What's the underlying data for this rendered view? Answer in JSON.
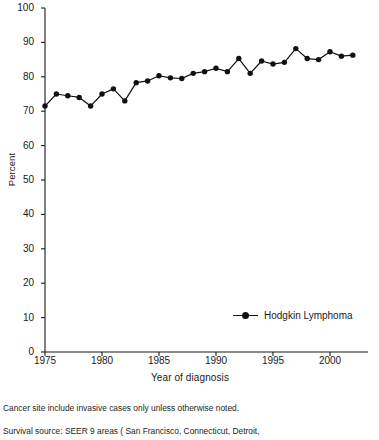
{
  "chart_data": {
    "type": "line",
    "title": "",
    "subtitle": "",
    "xlabel": "Year of diagnosis",
    "ylabel": "Percent",
    "xlim": [
      1975,
      2002
    ],
    "ylim": [
      0,
      100
    ],
    "ytick_values": [
      0,
      10,
      20,
      30,
      40,
      50,
      60,
      70,
      80,
      90,
      100
    ],
    "ytick_labels": [
      "0",
      "10",
      "20",
      "30",
      "40",
      "50",
      "60",
      "70",
      "80",
      "90",
      "100"
    ],
    "xtick_values": [
      1975,
      1980,
      1985,
      1990,
      1995,
      2000
    ],
    "xtick_labels": [
      "1975",
      "1980",
      "1985",
      "1990",
      "1995",
      "2000"
    ],
    "grid": false,
    "legend_position": "lower right",
    "legend_entries": [
      "Hodgkin Lymphoma"
    ],
    "marker": "filled-circle",
    "line_color": "#111111",
    "marker_color": "#111111",
    "x": [
      1975,
      1976,
      1977,
      1978,
      1979,
      1980,
      1981,
      1982,
      1983,
      1984,
      1985,
      1986,
      1987,
      1988,
      1989,
      1990,
      1991,
      1992,
      1993,
      1994,
      1995,
      1996,
      1997,
      1998,
      1999,
      2000,
      2001,
      2002
    ],
    "series": [
      {
        "name": "Hodgkin Lymphoma",
        "values": [
          71.5,
          75.0,
          74.5,
          74.0,
          71.5,
          75.0,
          76.5,
          73.0,
          78.3,
          78.8,
          80.3,
          79.7,
          79.5,
          81.0,
          81.5,
          82.5,
          81.5,
          85.3,
          81.0,
          84.6,
          83.7,
          84.2,
          88.2,
          85.3,
          85.0,
          87.3,
          86.0,
          86.3
        ]
      }
    ]
  },
  "footnote": {
    "line1": "Cancer site include invasive cases only unless otherwise noted.",
    "line2": "Survival source: SEER 9 areas ( San Francisco, Connecticut, Detroit,"
  }
}
